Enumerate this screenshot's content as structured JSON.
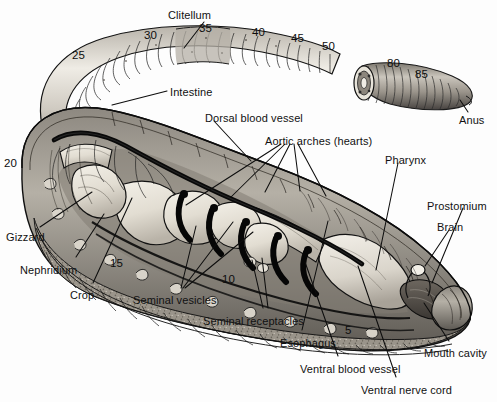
{
  "diagram": {
    "background_color": "#fdfdfd",
    "ink_color": "#111111",
    "body_tone_light": "#d8d4cc",
    "body_tone_mid": "#9a948b",
    "body_tone_dark": "#4a4641",
    "organ_tone": "#e6e2d8",
    "vessel_color": "#0a0a0a"
  },
  "labels": [
    {
      "id": "clitellum",
      "text": "Clitellum",
      "x": 168,
      "y": 10,
      "anchor": "start"
    },
    {
      "id": "intestine",
      "text": "Intestine",
      "x": 170,
      "y": 87,
      "anchor": "start"
    },
    {
      "id": "dorsal-blood-vessel",
      "text": "Dorsal blood vessel",
      "x": 205,
      "y": 113,
      "anchor": "start"
    },
    {
      "id": "aortic-arches",
      "text": "Aortic arches (hearts)",
      "x": 265,
      "y": 136,
      "anchor": "start"
    },
    {
      "id": "pharynx",
      "text": "Pharynx",
      "x": 385,
      "y": 155,
      "anchor": "start"
    },
    {
      "id": "prostomium",
      "text": "Prostomium",
      "x": 427,
      "y": 201,
      "anchor": "start"
    },
    {
      "id": "brain",
      "text": "Brain",
      "x": 437,
      "y": 222,
      "anchor": "start"
    },
    {
      "id": "anus",
      "text": "Anus",
      "x": 459,
      "y": 115,
      "anchor": "start"
    },
    {
      "id": "gizzard",
      "text": "Gizzard",
      "x": 6,
      "y": 232,
      "anchor": "start"
    },
    {
      "id": "nephridium",
      "text": "Nephridium",
      "x": 20,
      "y": 265,
      "anchor": "start"
    },
    {
      "id": "crop",
      "text": "Crop",
      "x": 70,
      "y": 290,
      "anchor": "start"
    },
    {
      "id": "seminal-vesicles",
      "text": "Seminal vesicles",
      "x": 133,
      "y": 295,
      "anchor": "start"
    },
    {
      "id": "seminal-receptacles",
      "text": "Seminal receptacles",
      "x": 203,
      "y": 316,
      "anchor": "start"
    },
    {
      "id": "esophagus",
      "text": "Esophagus",
      "x": 280,
      "y": 338,
      "anchor": "start"
    },
    {
      "id": "ventral-blood-vessel",
      "text": "Ventral blood vessel",
      "x": 300,
      "y": 364,
      "anchor": "start"
    },
    {
      "id": "ventral-nerve-cord",
      "text": "Ventral nerve cord",
      "x": 361,
      "y": 385,
      "anchor": "start"
    },
    {
      "id": "mouth-cavity",
      "text": "Mouth cavity",
      "x": 424,
      "y": 348,
      "anchor": "start"
    }
  ],
  "segment_numbers": [
    {
      "id": "seg-25",
      "text": "25",
      "x": 72,
      "y": 50
    },
    {
      "id": "seg-30",
      "text": "30",
      "x": 144,
      "y": 30
    },
    {
      "id": "seg-35",
      "text": "35",
      "x": 199,
      "y": 23
    },
    {
      "id": "seg-40",
      "text": "40",
      "x": 252,
      "y": 27
    },
    {
      "id": "seg-45",
      "text": "45",
      "x": 291,
      "y": 33
    },
    {
      "id": "seg-50",
      "text": "50",
      "x": 322,
      "y": 41
    },
    {
      "id": "seg-80",
      "text": "80",
      "x": 387,
      "y": 58
    },
    {
      "id": "seg-85",
      "text": "85",
      "x": 415,
      "y": 69
    },
    {
      "id": "seg-20",
      "text": "20",
      "x": 4,
      "y": 158
    },
    {
      "id": "seg-15",
      "text": "15",
      "x": 110,
      "y": 258
    },
    {
      "id": "seg-10",
      "text": "10",
      "x": 222,
      "y": 274
    },
    {
      "id": "seg-5",
      "text": "5",
      "x": 345,
      "y": 325
    }
  ],
  "leader_lines": [
    {
      "id": "leader-clitellum",
      "points": "204,22 184,48"
    },
    {
      "id": "leader-intestine",
      "points": "167,91 112,105"
    },
    {
      "id": "leader-dorsal-blood-vessel",
      "points": "214,121 251,161"
    },
    {
      "id": "leader-aortic-1",
      "points": "281,144 186,205"
    },
    {
      "id": "leader-aortic-2",
      "points": "285,144 231,197"
    },
    {
      "id": "leader-aortic-3",
      "points": "290,144 265,192"
    },
    {
      "id": "leader-aortic-4",
      "points": "294,144 300,191"
    },
    {
      "id": "leader-aortic-5",
      "points": "298,144 326,196"
    },
    {
      "id": "leader-pharynx",
      "points": "398,163 376,270"
    },
    {
      "id": "leader-prostomium",
      "points": "463,208 432,283"
    },
    {
      "id": "leader-brain",
      "points": "449,230 425,266"
    },
    {
      "id": "leader-gizzard",
      "points": "40,227 92,192"
    },
    {
      "id": "leader-nephridium",
      "points": "76,257 104,214"
    },
    {
      "id": "leader-crop",
      "points": "93,283 132,198"
    },
    {
      "id": "leader-sv-1",
      "points": "181,288 196,226"
    },
    {
      "id": "leader-sv-2",
      "points": "183,288 233,222"
    },
    {
      "id": "leader-sv-3",
      "points": "185,288 253,232"
    },
    {
      "id": "leader-sr-1",
      "points": "263,308 252,260"
    },
    {
      "id": "leader-sr-2",
      "points": "268,308 262,258"
    },
    {
      "id": "leader-esophagus",
      "points": "302,330 328,221"
    },
    {
      "id": "leader-ventral-blood-vessel",
      "points": "338,356 305,262"
    },
    {
      "id": "leader-ventral-nerve-cord",
      "points": "396,377 358,266"
    },
    {
      "id": "leader-mouth-cavity",
      "points": "449,341 424,303"
    },
    {
      "id": "leader-anus",
      "points": "468,112 460,100"
    }
  ]
}
